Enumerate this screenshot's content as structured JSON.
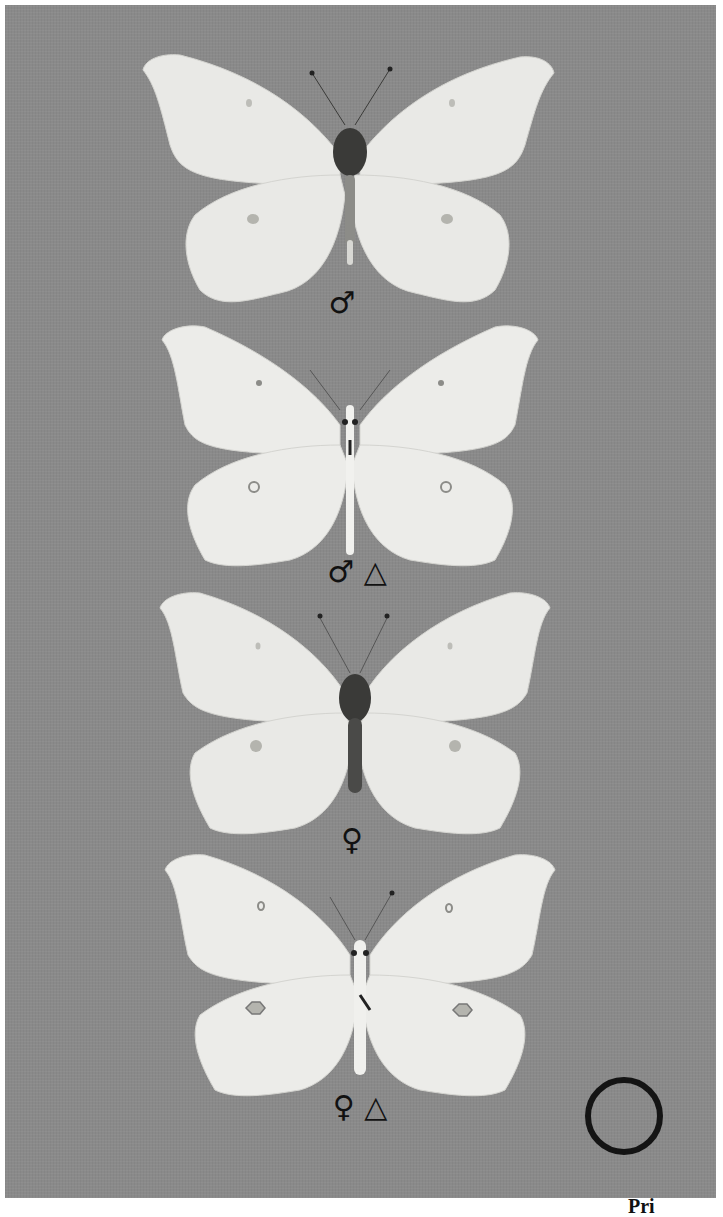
{
  "plate": {
    "background_color": "#8a8a8a",
    "wing_color": "#e9e9e6",
    "body_color": "#3a3a38"
  },
  "specimens": [
    {
      "id": 1,
      "view": "upperside",
      "label": "♂",
      "label_meaning": "male"
    },
    {
      "id": 2,
      "view": "underside",
      "label": "♂ △",
      "label_meaning": "male underside"
    },
    {
      "id": 3,
      "view": "upperside",
      "label": "♀",
      "label_meaning": "female"
    },
    {
      "id": 4,
      "view": "underside",
      "label": "♀ △",
      "label_meaning": "female underside"
    }
  ],
  "scale_ring": {
    "shape": "circle-outline",
    "color": "#141414"
  },
  "caption": {
    "text": "Pri"
  }
}
